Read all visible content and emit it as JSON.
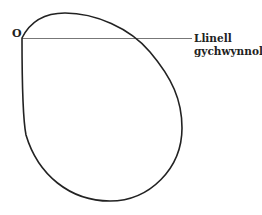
{
  "diagram": {
    "pole_label": "O",
    "initial_line_label_line1": "Llinell",
    "initial_line_label_line2": "gychwynnol",
    "colors": {
      "curve": "#222222",
      "initial_line": "#777777",
      "text": "#222222",
      "background": "#ffffff"
    }
  }
}
